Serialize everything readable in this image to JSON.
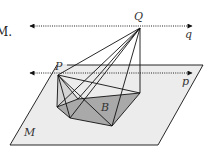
{
  "figure": {
    "prefix_text": "M.",
    "labels": {
      "Q": "Q",
      "q": "q",
      "P": "P",
      "p": "p",
      "B": "B",
      "M": "M"
    },
    "colors": {
      "plane_fill": "#ececec",
      "base_fill": "#a9a9a9",
      "stroke": "#111111",
      "dotted": "#222222"
    },
    "points": {
      "Q": [
        140,
        28
      ],
      "P": [
        58,
        75
      ],
      "base": [
        [
          57,
          107
        ],
        [
          70,
          118
        ],
        [
          112,
          126
        ],
        [
          140,
          93
        ],
        [
          78,
          99
        ]
      ]
    },
    "plane": [
      [
        57,
        65
      ],
      [
        203,
        65
      ],
      [
        158,
        145
      ],
      [
        10,
        145
      ]
    ],
    "lines": {
      "q": {
        "y": 26,
        "x1": 28,
        "x2": 193
      },
      "p": {
        "y": 73,
        "x1": 28,
        "x2": 193
      }
    }
  }
}
